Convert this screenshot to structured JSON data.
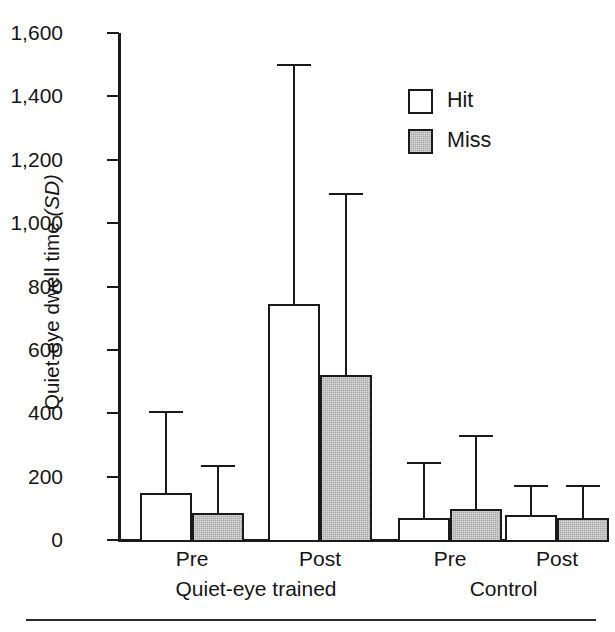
{
  "chart_data": {
    "type": "bar",
    "title": "",
    "xlabel": "",
    "ylabel": "Quiet-eye dwell time (SD)",
    "ylabel_plain": "Quiet-eye dwell time ",
    "ylabel_italic": "(SD)",
    "ylim": [
      0,
      1600
    ],
    "yticks": [
      0,
      200,
      400,
      600,
      800,
      1000,
      1200,
      1400,
      1600
    ],
    "ytick_labels": [
      "0",
      "200",
      "400",
      "600",
      "800",
      "1,000",
      "1,200",
      "1,400",
      "1,600"
    ],
    "grid": false,
    "legend_position": "upper right",
    "categories": [
      "Pre",
      "Post",
      "Pre",
      "Post"
    ],
    "group_labels": [
      "Quiet-eye trained",
      "Control"
    ],
    "group_spans": [
      [
        0,
        1
      ],
      [
        2,
        3
      ]
    ],
    "series": [
      {
        "name": "Hit",
        "fill": "#ffffff",
        "values": [
          148,
          745,
          70,
          80
        ],
        "errors_upper": [
          408,
          1502,
          247,
          175
        ],
        "sd": [
          260,
          757,
          177,
          95
        ]
      },
      {
        "name": "Miss",
        "fill": "#a9a9a9",
        "values": [
          85,
          520,
          97,
          68
        ],
        "errors_upper": [
          237,
          1094,
          332,
          175
        ],
        "sd": [
          152,
          574,
          235,
          107
        ]
      }
    ]
  },
  "legend": {
    "entries": [
      {
        "label": "Hit",
        "swatch": "hit"
      },
      {
        "label": "Miss",
        "swatch": "miss"
      }
    ]
  },
  "axis": {
    "baseline_value": "0",
    "top_value": "1,600"
  }
}
